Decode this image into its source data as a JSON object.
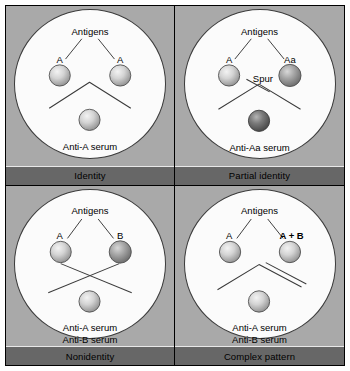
{
  "figure": {
    "colors": {
      "panel_background": "#a9a9a9",
      "plate_fill": "#fbfbfb",
      "caption_bar": "#676767",
      "line": "#3a3a3a",
      "well_light": "#d6d6d6",
      "well_mid": "#9a9a9a",
      "well_dark": "#6f6f6f"
    }
  },
  "panels": [
    {
      "id": "identity",
      "caption": "Identity",
      "antigens_label": "Antigens",
      "left_well_label": "A",
      "right_well_label": "A",
      "serum_lines": [
        "Anti-A serum"
      ],
      "left_well_shade": "light",
      "right_well_shade": "light",
      "serum_well_shade": "light",
      "pattern": "continuous-arc",
      "extra_label": ""
    },
    {
      "id": "partial-identity",
      "caption": "Partial identity",
      "antigens_label": "Antigens",
      "left_well_label": "A",
      "right_well_label": "Aa",
      "serum_lines": [
        "Anti-Aa serum"
      ],
      "left_well_shade": "light",
      "right_well_shade": "mid",
      "serum_well_shade": "dark",
      "pattern": "arc-with-spur",
      "extra_label": "Spur"
    },
    {
      "id": "nonidentity",
      "caption": "Nonidentity",
      "antigens_label": "Antigens",
      "left_well_label": "A",
      "right_well_label": "B",
      "serum_lines": [
        "Anti-A serum",
        "Anti-B serum"
      ],
      "left_well_shade": "light",
      "right_well_shade": "mid",
      "serum_well_shade": "light",
      "pattern": "crossed-lines",
      "extra_label": ""
    },
    {
      "id": "complex-pattern",
      "caption": "Complex pattern",
      "antigens_label": "Antigens",
      "left_well_label": "A",
      "right_well_label": "A + B",
      "serum_lines": [
        "Anti-A serum",
        "Anti-B serum"
      ],
      "left_well_shade": "light",
      "right_well_shade": "light",
      "serum_well_shade": "light",
      "pattern": "arc-plus-second-line",
      "extra_label": ""
    }
  ]
}
